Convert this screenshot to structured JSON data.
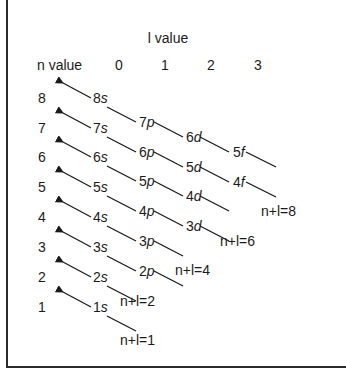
{
  "diagram": {
    "title": "l value",
    "n_header": "n value",
    "l_values": [
      "0",
      "1",
      "2",
      "3"
    ],
    "n_values": [
      "8",
      "7",
      "6",
      "5",
      "4",
      "3",
      "2",
      "1"
    ],
    "orbitals": {
      "s": [
        {
          "n": "8",
          "l": "s"
        },
        {
          "n": "7",
          "l": "s"
        },
        {
          "n": "6",
          "l": "s"
        },
        {
          "n": "5",
          "l": "s"
        },
        {
          "n": "4",
          "l": "s"
        },
        {
          "n": "3",
          "l": "s"
        },
        {
          "n": "2",
          "l": "s"
        },
        {
          "n": "1",
          "l": "s"
        }
      ],
      "p": [
        {
          "n": "7",
          "l": "p"
        },
        {
          "n": "6",
          "l": "p"
        },
        {
          "n": "5",
          "l": "p"
        },
        {
          "n": "4",
          "l": "p"
        },
        {
          "n": "3",
          "l": "p"
        },
        {
          "n": "2",
          "l": "p"
        }
      ],
      "d": [
        {
          "n": "6",
          "l": "d"
        },
        {
          "n": "5",
          "l": "d"
        },
        {
          "n": "4",
          "l": "d"
        },
        {
          "n": "3",
          "l": "d"
        }
      ],
      "f": [
        {
          "n": "5",
          "l": "f"
        },
        {
          "n": "4",
          "l": "f"
        }
      ]
    },
    "sum_labels": [
      "n+l=8",
      "n+l=6",
      "n+l=4",
      "n+l=2",
      "n+l=1"
    ]
  }
}
